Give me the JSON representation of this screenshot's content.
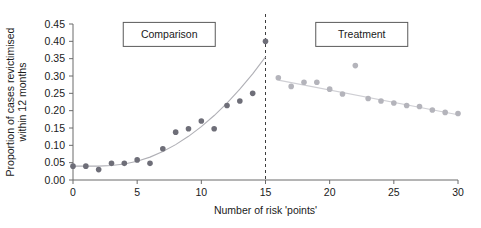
{
  "chart_data": {
    "type": "scatter",
    "title": "",
    "xlabel": "Number of risk 'points'",
    "ylabel": "Proportion of cases revictimised within 12 months",
    "xlim": [
      0,
      30
    ],
    "ylim": [
      0.0,
      0.45
    ],
    "grid": false,
    "legend_position": "none",
    "xticks": [
      0,
      5,
      10,
      15,
      20,
      25,
      30
    ],
    "xtick_labels": [
      "0",
      "5",
      "10",
      "15",
      "20",
      "25",
      "30"
    ],
    "yticks": [
      0.0,
      0.05,
      0.1,
      0.15,
      0.2,
      0.25,
      0.3,
      0.35,
      0.4,
      0.45
    ],
    "ytick_labels": [
      "0.00",
      "0.05",
      "0.10",
      "0.15",
      "0.20",
      "0.25",
      "0.30",
      "0.35",
      "0.40",
      "0.45"
    ],
    "annotations": [
      {
        "text": "Comparison",
        "x": 7.5,
        "y": 0.42,
        "boxed": true
      },
      {
        "text": "Treatment",
        "x": 22.5,
        "y": 0.42,
        "boxed": true
      }
    ],
    "reference_lines": [
      {
        "orientation": "vertical",
        "x": 15,
        "style": "dashed",
        "color": "#3d3d3d"
      }
    ],
    "series": [
      {
        "name": "Comparison",
        "type": "scatter",
        "color": "#6e6e78",
        "marker": "circle",
        "x": [
          0,
          1,
          2,
          3,
          4,
          5,
          6,
          7,
          8,
          9,
          10,
          11,
          12,
          13,
          14,
          15
        ],
        "values": [
          0.04,
          0.04,
          0.03,
          0.048,
          0.048,
          0.058,
          0.048,
          0.09,
          0.138,
          0.148,
          0.17,
          0.148,
          0.215,
          0.228,
          0.25,
          0.4
        ]
      },
      {
        "name": "Treatment",
        "type": "scatter",
        "color": "#b4b4bb",
        "marker": "circle",
        "x": [
          16,
          17,
          18,
          19,
          20,
          21,
          22,
          23,
          24,
          25,
          26,
          27,
          28,
          29,
          30
        ],
        "values": [
          0.295,
          0.27,
          0.282,
          0.282,
          0.262,
          0.248,
          0.33,
          0.235,
          0.228,
          0.222,
          0.215,
          0.212,
          0.202,
          0.195,
          0.192
        ]
      },
      {
        "name": "Comparison fitted curve",
        "type": "line",
        "color": "#b0b0b6",
        "x": [
          0,
          1,
          2,
          3,
          4,
          5,
          6,
          7,
          8,
          9,
          10,
          11,
          12,
          13,
          14,
          15
        ],
        "values": [
          0.04,
          0.04,
          0.04,
          0.042,
          0.046,
          0.054,
          0.066,
          0.082,
          0.102,
          0.126,
          0.154,
          0.186,
          0.222,
          0.262,
          0.306,
          0.355
        ]
      },
      {
        "name": "Treatment fitted line",
        "type": "line",
        "color": "#cfcfd4",
        "x": [
          16,
          30
        ],
        "values": [
          0.288,
          0.188
        ]
      }
    ]
  },
  "axes": {
    "x_title": "Number of risk 'points'",
    "y_title_line1": "Proportion of cases revictimised",
    "y_title_line2": "within 12 months"
  },
  "annotations": {
    "comparison_label": "Comparison",
    "treatment_label": "Treatment"
  },
  "colors": {
    "comparison_marker": "#6e6e78",
    "treatment_marker": "#b4b4bb",
    "comparison_fit": "#b0b0b6",
    "treatment_fit": "#cfcfd4",
    "axis": "#6b6b6b",
    "divider": "#3d3d3d",
    "text": "#1a1a1a"
  }
}
